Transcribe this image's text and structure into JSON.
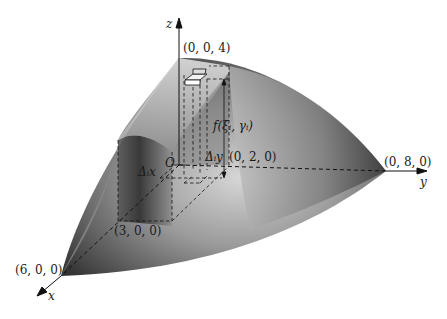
{
  "figure": {
    "axes": {
      "x": "x",
      "y": "y",
      "z": "z",
      "origin": "O"
    },
    "points": {
      "z_intercept": "(0, 0, 4)",
      "y_intercept": "(0, 8, 0)",
      "x_intercept": "(6, 0, 0)",
      "x_mid": "(3, 0, 0)",
      "y_mid": "(0, 2, 0)"
    },
    "annotations": {
      "height": "f(ξᵢ, γᵢ)",
      "delta_x": "Δᵢx",
      "delta_y": "Δᵢy"
    },
    "colors": {
      "surface_dark": "#2b2b2b",
      "surface_light": "#d8d8d8",
      "ink": "#111111"
    }
  }
}
